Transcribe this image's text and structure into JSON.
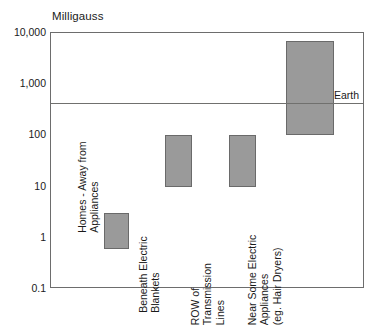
{
  "chart_data": {
    "type": "bar",
    "title": "Milligauss",
    "xlabel": "",
    "ylabel": "Milligauss",
    "yscale": "log",
    "ylim": [
      0.1,
      10000
    ],
    "grid": false,
    "legend": "none",
    "ytick_labels": [
      "10,000",
      "1,000",
      "100",
      "10",
      "1",
      "0.1"
    ],
    "ytick_values": [
      10000,
      1000,
      100,
      10,
      1,
      0.1
    ],
    "categories": [
      "Homes - Away from\nAppliances",
      "Beneath Electric\nBlankets",
      "ROW of\nTransmission\nLines",
      "Near Some Electric\nAppliances\n(eg. Hair Dryers)"
    ],
    "bars": [
      {
        "label": "Homes - Away from\nAppliances",
        "low": 0.6,
        "high": 3
      },
      {
        "label": "Beneath Electric\nBlankets",
        "low": 10,
        "high": 100
      },
      {
        "label": "ROW of\nTransmission\nLines",
        "low": 10,
        "high": 100
      },
      {
        "label": "Near Some Electric\nAppliances\n(eg. Hair Dryers)",
        "low": 100,
        "high": 7000
      }
    ],
    "reference_lines": [
      {
        "label": "Earth",
        "value": 430
      }
    ],
    "colors": {
      "bar_fill": "#9a9a9a",
      "bar_stroke": "#6a6a6a",
      "axis": "#6d6d6d",
      "reference_line": "#70706e",
      "text": "#1a1a1a",
      "background": "#ffffff"
    }
  }
}
